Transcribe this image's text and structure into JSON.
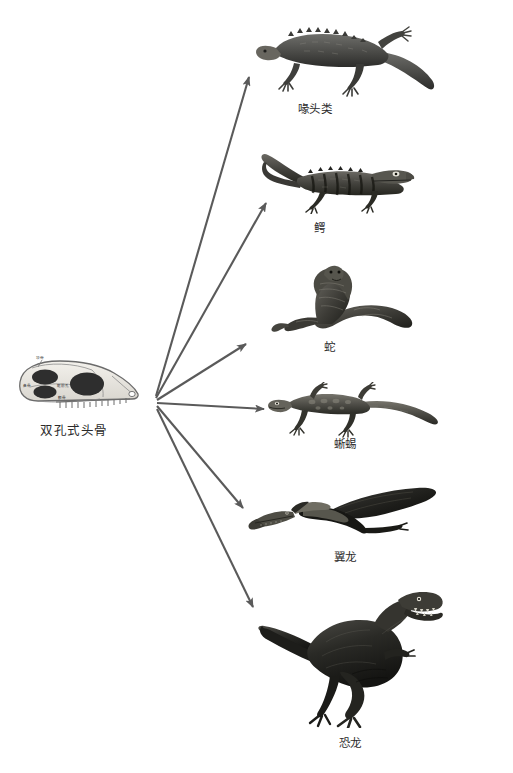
{
  "figure": {
    "type": "cladogram-diagram",
    "background_color": "#ffffff",
    "line_color": "#5a5a5a",
    "text_color": "#2b2b2b"
  },
  "source_node": {
    "caption": "双孔式头骨",
    "skull_labels": {
      "upper": "顶骨",
      "left": "鼻骨",
      "middle": "眶前孔",
      "lower": "颧骨"
    }
  },
  "branches": [
    {
      "id": "tuatara",
      "label": "喙头类",
      "icon": "tuatara-illustration"
    },
    {
      "id": "crocodile",
      "label": "鳄",
      "icon": "crocodile-illustration"
    },
    {
      "id": "snake",
      "label": "蛇",
      "icon": "cobra-illustration"
    },
    {
      "id": "lizard",
      "label": "蜥蜴",
      "icon": "lizard-illustration"
    },
    {
      "id": "pterosaur",
      "label": "翼龙",
      "icon": "pterosaur-illustration"
    },
    {
      "id": "dinosaur",
      "label": "恐龙",
      "icon": "tyrannosaurus-illustration"
    }
  ]
}
